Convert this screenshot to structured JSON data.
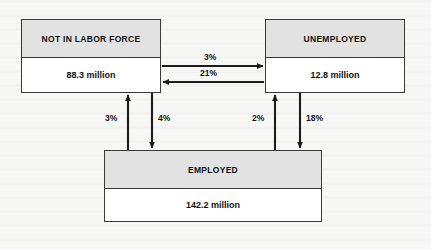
{
  "diagram": {
    "units": "million",
    "colors": {
      "header_fill": "#e2e2e2",
      "body_fill": "#ffffff",
      "border": "#3a3a3a",
      "arrow": "#1c1c1c",
      "background": "#f7f7f5"
    },
    "nodes": [
      {
        "id": "not-in-labor-force",
        "label": "NOT IN LABOR FORCE",
        "value": "88.3 million"
      },
      {
        "id": "unemployed",
        "label": "UNEMPLOYED",
        "value": "12.8 million"
      },
      {
        "id": "employed",
        "label": "EMPLOYED",
        "value": "142.2 million"
      }
    ],
    "flows": [
      {
        "id": "nilf-to-unemployed",
        "from": "not-in-labor-force",
        "to": "unemployed",
        "label": "3%",
        "direction": "right"
      },
      {
        "id": "unemployed-to-nilf",
        "from": "unemployed",
        "to": "not-in-labor-force",
        "label": "21%",
        "direction": "left"
      },
      {
        "id": "employed-to-nilf",
        "from": "employed",
        "to": "not-in-labor-force",
        "label": "3%",
        "direction": "up"
      },
      {
        "id": "nilf-to-employed",
        "from": "not-in-labor-force",
        "to": "employed",
        "label": "4%",
        "direction": "down"
      },
      {
        "id": "employed-to-unemployed_up",
        "from": "employed",
        "to": "unemployed",
        "label": "2%",
        "direction": "up"
      },
      {
        "id": "unemployed-to-employed",
        "from": "unemployed",
        "to": "employed",
        "label": "18%",
        "direction": "down"
      }
    ]
  }
}
